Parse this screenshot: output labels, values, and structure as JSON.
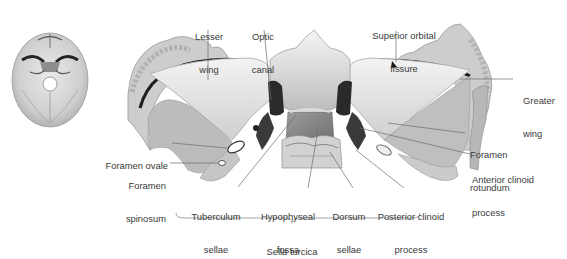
{
  "figure": {
    "colors": {
      "bone_light": "#eeeeee",
      "bone_mid": "#c8c8c8",
      "bone_dark": "#8a8a8a",
      "shadow": "#1e1e1e",
      "leader_line": "#6b6b6b",
      "label_text": "#3a3a3a"
    }
  },
  "thumbnail": {
    "description": "Skull base orientation thumbnail"
  },
  "labels": {
    "lesser_wing": {
      "line1": "Lesser",
      "line2": "wing"
    },
    "optic_canal": {
      "line1": "Optic",
      "line2": "canal"
    },
    "superior_orbital_fissure": {
      "line1": "Superior orbital",
      "line2": "fissure"
    },
    "greater_wing": {
      "line1": "Greater",
      "line2": "wing"
    },
    "foramen_ovale": {
      "line1": "Foramen ovale"
    },
    "foramen_spinosum": {
      "line1": "Foramen",
      "line2": "spinosum"
    },
    "foramen_rotundum": {
      "line1": "Foramen",
      "line2": "rotundum"
    },
    "anterior_clinoid_process": {
      "line1": "Anterior clinoid",
      "line2": "process"
    },
    "tuberculum_sellae": {
      "line1": "Tuberculum",
      "line2": "sellae"
    },
    "hypophyseal_fossa": {
      "line1": "Hypophyseal",
      "line2": "fossa"
    },
    "dorsum_sellae": {
      "line1": "Dorsum",
      "line2": "sellae"
    },
    "posterior_clinoid_process": {
      "line1": "Posterior clinoid",
      "line2": "process"
    },
    "sella_turcica": {
      "line1": "Sella turcica"
    }
  }
}
